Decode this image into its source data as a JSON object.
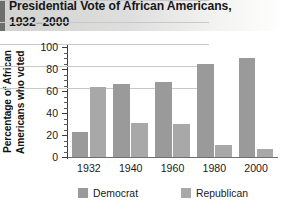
{
  "header": {
    "title": "Presidential Vote of African Americans,\n1932–2000",
    "accent_color": "#6e6e6c"
  },
  "axis": {
    "y_title_line1": "Percentage of African",
    "y_title_line2": "Americans who voted",
    "y_ticks": [
      "0",
      "20",
      "40",
      "60",
      "80",
      "100"
    ],
    "x_ticks": [
      "1932",
      "1940",
      "1960",
      "1980",
      "2000"
    ]
  },
  "legend": {
    "items": [
      {
        "label": "Democrat",
        "color": "#9a9a9a"
      },
      {
        "label": "Republican",
        "color": "#a8a8a8"
      }
    ]
  },
  "chart_data": {
    "type": "bar",
    "title": "Presidential Vote of African Americans, 1932–2000",
    "xlabel": "",
    "ylabel": "Percentage of African Americans who voted",
    "categories": [
      "1932",
      "1940",
      "1960",
      "1980",
      "2000"
    ],
    "series": [
      {
        "name": "Democrat",
        "color": "#9a9a9a",
        "values": [
          23,
          66,
          68,
          85,
          90
        ]
      },
      {
        "name": "Republican",
        "color": "#a8a8a8",
        "values": [
          64,
          31,
          30,
          11,
          7
        ]
      }
    ],
    "ylim": [
      0,
      100
    ],
    "ytick_step": 20,
    "grid": true,
    "legend_position": "bottom"
  }
}
